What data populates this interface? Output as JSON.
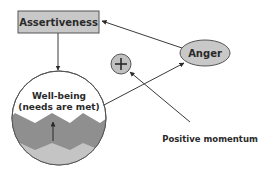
{
  "diagram": {
    "nodes": {
      "assertiveness": {
        "label": "Assertiveness",
        "shape": "rectangle",
        "fill": "#c8c8c8"
      },
      "anger": {
        "label": "Anger",
        "shape": "ellipse",
        "fill": "#c8c8c8"
      },
      "plus": {
        "label": "+",
        "shape": "circle",
        "fill": "#c0c0c0"
      },
      "wellbeing": {
        "label_line1": "Well-being",
        "label_line2": "(needs are met)",
        "shape": "circle",
        "dark_band_color": "#8f8f8f",
        "light_band_color": "#c4c4c4"
      },
      "positive_momentum": {
        "label": "Positive momentum",
        "shape": "text"
      }
    },
    "edges": [
      {
        "from": "assertiveness",
        "to": "wellbeing"
      },
      {
        "from": "anger",
        "to": "assertiveness"
      },
      {
        "from": "wellbeing",
        "to": "anger"
      },
      {
        "from": "positive_momentum",
        "to": "plus"
      }
    ],
    "colors": {
      "line": "#3a3a3a",
      "text": "#2a2a2a",
      "background": "#ffffff"
    }
  }
}
